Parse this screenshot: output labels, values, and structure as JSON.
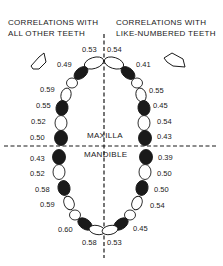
{
  "headings": {
    "left": [
      "CORRELATIONS WITH",
      "ALL OTHER TEETH"
    ],
    "right": [
      "CORRELATIONS WITH",
      "LIKE-NUMBERED TEETH"
    ]
  },
  "jaws": {
    "upper": "MAXILLA",
    "lower": "MANDIBLE"
  },
  "legend_arrows": {
    "left": "arrow-pointing-left-icon",
    "right": "arrow-pointing-right-icon"
  },
  "colors": {
    "filled_tooth": "#1a1a1a",
    "open_tooth": "#ffffff",
    "line": "#1a1a1a"
  },
  "maxilla": {
    "left_labels": [
      "0.53",
      "0.49",
      "0.59",
      "0.55",
      "0.52",
      "0.50"
    ],
    "right_labels": [
      "0.54",
      "0.41",
      "0.55",
      "0.45",
      "0.54",
      "0.43"
    ]
  },
  "mandible": {
    "left_labels": [
      "0.43",
      "0.52",
      "0.58",
      "0.59",
      "0.60",
      "0.58"
    ],
    "right_labels": [
      "0.39",
      "0.50",
      "0.50",
      "0.54",
      "0.45",
      "0.53"
    ]
  }
}
